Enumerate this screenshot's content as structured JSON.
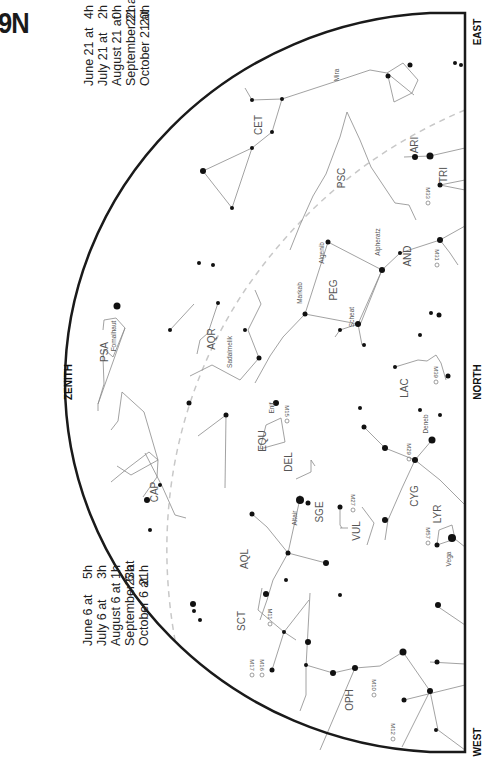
{
  "title": "9N",
  "directions": {
    "east": "EAST",
    "north": "NORTH",
    "west": "WEST",
    "zenith": "ZENITH"
  },
  "times_top": {
    "dates": [
      "June 21 at",
      "July 21 at",
      "August 21 at",
      "September 21 at",
      "October 21 at"
    ],
    "hours": [
      "4h",
      "2h",
      "0h",
      "22h",
      "20h"
    ]
  },
  "times_bottom": {
    "dates": [
      "June 6 at",
      "July 6 at",
      "August 6 at",
      "September 6 at",
      "October 6 at"
    ],
    "hours": [
      "5h",
      "3h",
      "1h",
      "23h",
      "21h"
    ]
  },
  "constellations": [
    {
      "id": "CET",
      "label": "CET",
      "x": 262,
      "y": 125
    },
    {
      "id": "PSC",
      "label": "PSC",
      "x": 345,
      "y": 178
    },
    {
      "id": "ARI",
      "label": "ARI",
      "x": 418,
      "y": 145
    },
    {
      "id": "TRI",
      "label": "TRI",
      "x": 447,
      "y": 175
    },
    {
      "id": "AND",
      "label": "AND",
      "x": 411,
      "y": 256
    },
    {
      "id": "PEG",
      "label": "PEG",
      "x": 337,
      "y": 290
    },
    {
      "id": "PSA",
      "label": "PSA",
      "x": 108,
      "y": 352
    },
    {
      "id": "AQR",
      "label": "AQR",
      "x": 215,
      "y": 339
    },
    {
      "id": "LAC",
      "label": "LAC",
      "x": 408,
      "y": 388
    },
    {
      "id": "EQU",
      "label": "EQU",
      "x": 266,
      "y": 441
    },
    {
      "id": "DEL",
      "label": "DEL",
      "x": 292,
      "y": 462
    },
    {
      "id": "CAP",
      "label": "CAP",
      "x": 158,
      "y": 492
    },
    {
      "id": "SGE",
      "label": "SGE",
      "x": 323,
      "y": 512
    },
    {
      "id": "CYG",
      "label": "CYG",
      "x": 418,
      "y": 496
    },
    {
      "id": "VUL",
      "label": "VUL",
      "x": 360,
      "y": 531
    },
    {
      "id": "LYR",
      "label": "LYR",
      "x": 441,
      "y": 514
    },
    {
      "id": "AQL",
      "label": "AQL",
      "x": 248,
      "y": 559
    },
    {
      "id": "SCT",
      "label": "SCT",
      "x": 245,
      "y": 621
    },
    {
      "id": "OPH",
      "label": "OPH",
      "x": 353,
      "y": 700
    }
  ],
  "star_names": [
    {
      "label": "Mira",
      "x": 339,
      "y": 75
    },
    {
      "label": "Fomalhaut",
      "x": 116,
      "y": 336
    },
    {
      "label": "Sadalmelik",
      "x": 232,
      "y": 352
    },
    {
      "label": "Markab",
      "x": 302,
      "y": 293
    },
    {
      "label": "Algenib",
      "x": 324,
      "y": 253
    },
    {
      "label": "Alpheratz",
      "x": 380,
      "y": 242
    },
    {
      "label": "Scheat",
      "x": 354,
      "y": 317
    },
    {
      "label": "Enif",
      "x": 274,
      "y": 408
    },
    {
      "label": "Deneb",
      "x": 428,
      "y": 424
    },
    {
      "label": "Altair",
      "x": 297,
      "y": 518
    },
    {
      "label": "Vega",
      "x": 451,
      "y": 559
    }
  ],
  "deep_sky": [
    {
      "label": "M33",
      "x": 426,
      "y": 193
    },
    {
      "label": "M31",
      "x": 435,
      "y": 255
    },
    {
      "label": "M39",
      "x": 434,
      "y": 372
    },
    {
      "label": "M15",
      "x": 285,
      "y": 411
    },
    {
      "label": "M29",
      "x": 407,
      "y": 449
    },
    {
      "label": "M27",
      "x": 351,
      "y": 500
    },
    {
      "label": "M57",
      "x": 426,
      "y": 533
    },
    {
      "label": "M11",
      "x": 268,
      "y": 614
    },
    {
      "label": "M16",
      "x": 260,
      "y": 665
    },
    {
      "label": "M17",
      "x": 250,
      "y": 665
    },
    {
      "label": "M10",
      "x": 372,
      "y": 685
    },
    {
      "label": "M12",
      "x": 391,
      "y": 729
    }
  ],
  "colors": {
    "horizon": "#1a1a1a",
    "lines": "#8a8a8a",
    "ecliptic": "#c8c8c8",
    "stars": "#111111"
  }
}
